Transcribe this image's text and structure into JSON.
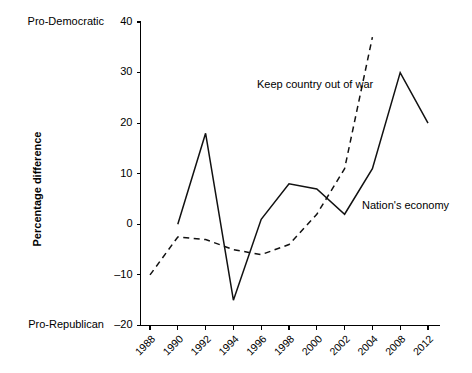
{
  "chart_data": {
    "type": "line",
    "title": "",
    "xlabel": "",
    "ylabel": "Percentage difference",
    "ylim": [
      -20,
      40
    ],
    "yticks": [
      -20,
      -10,
      0,
      10,
      20,
      30,
      40
    ],
    "ytick_labels": [
      "–20",
      "–10",
      "0",
      "10",
      "20",
      "30",
      "40"
    ],
    "grid": false,
    "legend_position": "inline-annotations",
    "axis_pole_labels": {
      "top": "Pro-Democratic",
      "bottom": "Pro-Republican"
    },
    "categories": [
      "1988",
      "1990",
      "1992",
      "1994",
      "1996",
      "1998",
      "2000",
      "2002",
      "2004",
      "2008",
      "2012"
    ],
    "series": [
      {
        "name": "Nation's economy",
        "style": "solid",
        "color": "#111111",
        "x": [
          "1990",
          "1992",
          "1994",
          "1996",
          "1998",
          "2000",
          "2002",
          "2004",
          "2008",
          "2012"
        ],
        "values": [
          0,
          18,
          -15,
          1,
          8,
          7,
          2,
          11,
          30,
          20
        ]
      },
      {
        "name": "Keep country out of war",
        "style": "dashed",
        "color": "#111111",
        "x": [
          "1988",
          "1990",
          "1992",
          "1994",
          "1996",
          "1998",
          "2000",
          "2002",
          "2004"
        ],
        "values": [
          -10,
          -2.5,
          -3,
          -5,
          -6,
          -4,
          2,
          11,
          37
        ]
      }
    ],
    "annotations": [
      {
        "label": "Keep country out of war",
        "x_px": 257,
        "y_px": 88
      },
      {
        "label": "Nation's economy",
        "x_px": 362,
        "y_px": 209
      }
    ]
  },
  "axis": {
    "y_title": "Percentage difference",
    "top_pole": "Pro-Democratic",
    "bottom_pole": "Pro-Republican"
  }
}
